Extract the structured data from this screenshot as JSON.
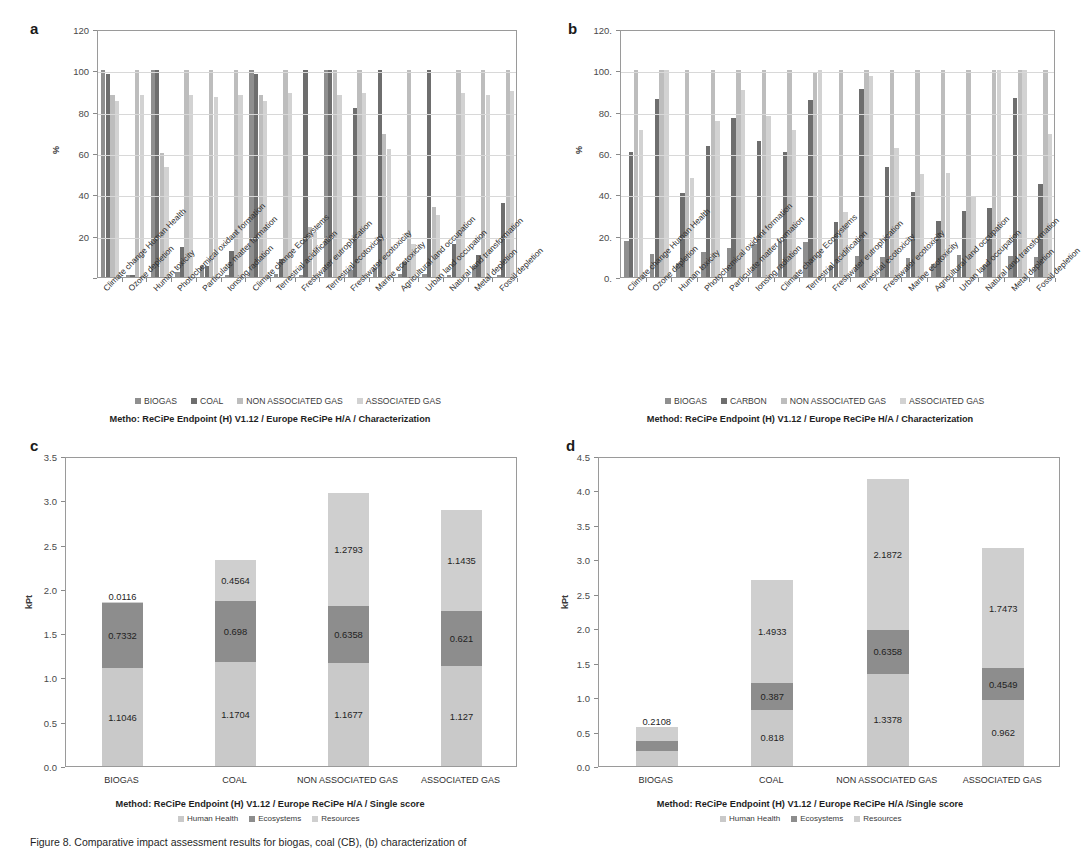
{
  "figure": {
    "caption": "Figure 8. Comparative impact assessment results for biogas, coal (CB), (b) characterization of"
  },
  "panels": {
    "a": {
      "letter": "a",
      "ylabel": "%",
      "caption": "Metho: ReCiPe Endpoint (H) V1.12 / Europe ReCiPe H/A / Characterization",
      "legend": [
        {
          "label": "BIOGAS",
          "color": "#8f8f8f"
        },
        {
          "label": "COAL",
          "color": "#6e6e6e"
        },
        {
          "label": "NON ASSOCIATED GAS",
          "color": "#bdbdbd"
        },
        {
          "label": "ASSOCIATED GAS",
          "color": "#d2d2d2"
        }
      ]
    },
    "b": {
      "letter": "b",
      "ylabel": "%",
      "caption": "Method: ReCiPe Endpoint (H) V1.12 / Europe ReCiPe H/A / Characterization",
      "legend": [
        {
          "label": "BIOGAS",
          "color": "#8f8f8f"
        },
        {
          "label": "CARBON",
          "color": "#6e6e6e"
        },
        {
          "label": "NON ASSOCIATED GAS",
          "color": "#bdbdbd"
        },
        {
          "label": "ASSOCIATED GAS",
          "color": "#d2d2d2"
        }
      ]
    },
    "c": {
      "letter": "c",
      "ylabel": "kPt",
      "caption": "Method: ReCiPe Endpoint (H) V1.12 / Europe ReCiPe H/A / Single score",
      "legend": [
        {
          "label": "Human Health",
          "color": "#c9c9c9"
        },
        {
          "label": "Ecosystems",
          "color": "#8d8d8d"
        },
        {
          "label": "Resources",
          "color": "#cfcfcf"
        }
      ]
    },
    "d": {
      "letter": "d",
      "ylabel": "kPt",
      "caption": "Method: ReCiPe Endpoint (H) V1.12 / Europe ReCiPe H/A /Single score",
      "legend": [
        {
          "label": "Human Health",
          "color": "#c9c9c9"
        },
        {
          "label": "Ecosystems",
          "color": "#8d8d8d"
        },
        {
          "label": "Resources",
          "color": "#cfcfcf"
        }
      ]
    }
  },
  "chart_data": [
    {
      "id": "a",
      "type": "bar",
      "title": "Metho: ReCiPe Endpoint (H) V1.12 / Europe ReCiPe H/A / Characterization",
      "xlabel": "",
      "ylabel": "%",
      "ylim": [
        0,
        120
      ],
      "yticks": [
        0,
        20,
        40,
        60,
        80,
        100,
        120
      ],
      "ytick_labels": [
        "",
        "20",
        "40",
        "60",
        "80",
        "100",
        "120"
      ],
      "grid": true,
      "legend_position": "bottom",
      "categories": [
        "Climate change Human Health",
        "Ozone depletion",
        "Human toxicity",
        "Photochemical oxidant formation",
        "Particulate matter formation",
        "Ionsing radiation",
        "Climate change Ecosystems",
        "Terrestrial acidification",
        "Freshwater eutrophication",
        "Terrestrial ecotoxicity",
        "Freshwater ecotoxicity",
        "Marine ecotoxicity",
        "Agricultural land occupation",
        "Urban land occupation",
        "Natural land transformation",
        "Metal depletion",
        "Fossil depletion"
      ],
      "series": [
        {
          "name": "BIOGAS",
          "color": "#8f8f8f",
          "values": [
            100,
            1,
            100,
            2.5,
            5.5,
            1,
            100,
            1.5,
            1,
            100,
            3.5,
            4.5,
            1.5,
            1.5,
            1,
            5.5,
            1
          ]
        },
        {
          "name": "COAL",
          "color": "#6e6e6e",
          "values": [
            98,
            1,
            100,
            14.5,
            5.5,
            12.5,
            98,
            8.5,
            100,
            100,
            82,
            100,
            7.5,
            100,
            16,
            10.5,
            36
          ]
        },
        {
          "name": "NON ASSOCIATED GAS",
          "color": "#bdbdbd",
          "values": [
            88,
            100,
            60,
            100,
            100,
            100,
            88,
            100,
            24,
            100,
            100,
            69,
            100,
            34,
            100,
            100,
            100
          ]
        },
        {
          "name": "ASSOCIATED GAS",
          "color": "#d2d2d2",
          "values": [
            85,
            88,
            53,
            88,
            87,
            88,
            85,
            89,
            22,
            88,
            89,
            62,
            16,
            30,
            89,
            88,
            90
          ]
        }
      ]
    },
    {
      "id": "b",
      "type": "bar",
      "title": "Method: ReCiPe Endpoint (H) V1.12 / Europe ReCiPe H/A / Characterization",
      "xlabel": "",
      "ylabel": "%",
      "ylim": [
        0,
        120
      ],
      "yticks": [
        0,
        20,
        40,
        60,
        80,
        100,
        120
      ],
      "ytick_labels": [
        "0.",
        "20.",
        "40.",
        "60.",
        "80.",
        "100.",
        "120."
      ],
      "grid": true,
      "legend_position": "bottom",
      "categories": [
        "Climate change Human Health",
        "Ozone depletion",
        "Human toxicity",
        "Photochemical oxidant formation",
        "Particulate matter formation",
        "Ionsing radiation",
        "Climate change Ecosystems",
        "Terrestrial acidification",
        "Freshwater eutrophication",
        "Terrestrial ecotoxicity",
        "Freshwater ecotoxicity",
        "Marine ecotoxicity",
        "Agricultural land occupation",
        "Urban land occupation",
        "Natural land transformation",
        "Metal depletion",
        "Fossil depletion"
      ],
      "series": [
        {
          "name": "BIOGAS",
          "color": "#8f8f8f",
          "values": [
            17.5,
            11,
            7,
            12,
            14,
            16,
            17.5,
            17,
            5.5,
            10,
            9.5,
            9,
            6.5,
            10.5,
            6,
            10,
            9.5
          ]
        },
        {
          "name": "CARBON",
          "color": "#6e6e6e",
          "values": [
            60.5,
            86,
            40.5,
            63.5,
            77,
            66,
            60.5,
            85.5,
            26.5,
            91,
            53,
            41,
            27,
            32,
            33.5,
            86.5,
            45
          ]
        },
        {
          "name": "NON ASSOCIATED GAS",
          "color": "#bdbdbd",
          "values": [
            100,
            100,
            100,
            100,
            100,
            100,
            100,
            99,
            100,
            100,
            100,
            100,
            100,
            100,
            100,
            100,
            100
          ]
        },
        {
          "name": "ASSOCIATED GAS",
          "color": "#d2d2d2",
          "values": [
            71,
            100,
            48,
            75.5,
            90.5,
            78,
            71,
            100,
            31.5,
            97.5,
            62.5,
            50,
            50.5,
            38.5,
            100,
            100,
            69
          ]
        }
      ]
    },
    {
      "id": "c",
      "type": "bar",
      "stacked": true,
      "title": "Method: ReCiPe Endpoint (H) V1.12 / Europe ReCiPe H/A / Single score",
      "xlabel": "",
      "ylabel": "kPt",
      "ylim": [
        0,
        3.5
      ],
      "yticks": [
        0.0,
        0.5,
        1.0,
        1.5,
        2.0,
        2.5,
        3.0,
        3.5
      ],
      "ytick_labels": [
        "0.0",
        "0.5",
        "1.0",
        "1.5",
        "2.0",
        "2.5",
        "3.0",
        "3.5"
      ],
      "grid": false,
      "legend_position": "bottom",
      "categories": [
        "BIOGAS",
        "COAL",
        "NON ASSOCIATED GAS",
        "ASSOCIATED GAS"
      ],
      "series": [
        {
          "name": "Human Health",
          "color": "#c9c9c9",
          "values": [
            1.1046,
            1.1704,
            1.1677,
            1.127
          ],
          "labels": [
            "1.1046",
            "1.1704",
            "1.1677",
            "1.127"
          ]
        },
        {
          "name": "Ecosystems",
          "color": "#8d8d8d",
          "values": [
            0.7332,
            0.698,
            0.6358,
            0.621
          ],
          "labels": [
            "0.7332",
            "0.698",
            "0.6358",
            "0.621"
          ]
        },
        {
          "name": "Resources",
          "color": "#cfcfcf",
          "values": [
            0.0116,
            0.4564,
            1.2793,
            1.1435
          ],
          "labels": [
            "0.0116",
            "0.4564",
            "1.2793",
            "1.1435"
          ]
        }
      ],
      "totals": [
        1.8494,
        2.3248,
        3.0828,
        2.8915
      ]
    },
    {
      "id": "d",
      "type": "bar",
      "stacked": true,
      "title": "Method: ReCiPe Endpoint (H) V1.12 / Europe ReCiPe H/A /Single score",
      "xlabel": "",
      "ylabel": "kPt",
      "ylim": [
        0,
        4.5
      ],
      "yticks": [
        0.0,
        0.5,
        1.0,
        1.5,
        2.0,
        2.5,
        3.0,
        3.5,
        4.0,
        4.5
      ],
      "ytick_labels": [
        "0.0",
        "0.5",
        "1.0",
        "1.5",
        "2.0",
        "2.5",
        "3.0",
        "3.5",
        "4.0",
        "4.5"
      ],
      "grid": false,
      "legend_position": "bottom",
      "categories": [
        "BIOGAS",
        "COAL",
        "NON ASSOCIATED GAS",
        "ASSOCIATED GAS"
      ],
      "series": [
        {
          "name": "Human Health",
          "color": "#c9c9c9",
          "values": [
            0.2114,
            0.818,
            1.3378,
            0.962
          ],
          "labels": [
            "0.2114",
            "0.818",
            "1.3378",
            "0.962"
          ]
        },
        {
          "name": "Ecosystems",
          "color": "#8d8d8d",
          "values": [
            0.1462,
            0.387,
            0.6358,
            0.4549
          ],
          "labels": [
            "0.1462",
            "0.387",
            "0.6358",
            "0.4549"
          ]
        },
        {
          "name": "Resources",
          "color": "#cfcfcf",
          "values": [
            0.2108,
            1.4933,
            2.1872,
            1.7473
          ],
          "labels": [
            "0.2108",
            "1.4933",
            "2.1872",
            "1.7473"
          ]
        }
      ],
      "totals": [
        0.5684,
        2.6983,
        4.1608,
        3.1642
      ]
    }
  ]
}
